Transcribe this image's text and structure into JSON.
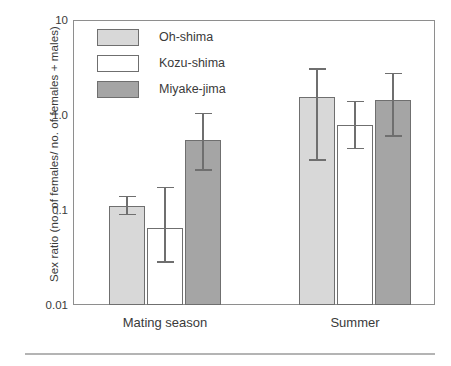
{
  "chart_data": {
    "type": "bar",
    "title": "",
    "subtitle": "",
    "xlabel": "",
    "ylabel": "Sex ratio (no. of females/ no. of females + males)",
    "categories": [
      "Mating season",
      "Summer"
    ],
    "yscale": "log",
    "ylim": [
      0.01,
      10
    ],
    "yticks": [
      0.01,
      0.1,
      1.0,
      10
    ],
    "ytick_labels": [
      "0.01",
      "0.1",
      "1.0",
      "10"
    ],
    "grid": false,
    "legend_position": "top-left",
    "error_bars": true,
    "series": [
      {
        "name": "Oh-shima",
        "color": "#d8d8d8",
        "values": [
          0.11,
          1.55
        ],
        "err_low": [
          0.088,
          0.33
        ],
        "err_high": [
          0.14,
          3.1
        ]
      },
      {
        "name": "Kozu-shima",
        "color": "#ffffff",
        "values": [
          0.065,
          0.79
        ],
        "err_low": [
          0.028,
          0.44
        ],
        "err_high": [
          0.175,
          1.4
        ]
      },
      {
        "name": "Miyake-jima",
        "color": "#a5a5a5",
        "values": [
          0.55,
          1.45
        ],
        "err_low": [
          0.26,
          0.59
        ],
        "err_high": [
          1.05,
          2.8
        ]
      }
    ]
  },
  "axis": {
    "y_title": "Sex ratio (no. of females/ no. of females + males)",
    "y_tick_labels": [
      "10",
      "1.0",
      "0.1",
      "0.01"
    ],
    "x_tick_labels": [
      "Mating season",
      "Summer"
    ]
  },
  "legend": {
    "items": [
      {
        "label": "Oh-shima",
        "color": "#d8d8d8"
      },
      {
        "label": "Kozu-shima",
        "color": "#ffffff"
      },
      {
        "label": "Miyake-jima",
        "color": "#a5a5a5"
      }
    ]
  },
  "colors": {
    "oh_shima": "#d8d8d8",
    "kozu_shima": "#ffffff",
    "miyake_jima": "#a5a5a5",
    "axis": "#8e8e8e",
    "bar_outline": "#6f6f6f",
    "text": "#3a3a3a",
    "rule": "#b4b4b4"
  }
}
